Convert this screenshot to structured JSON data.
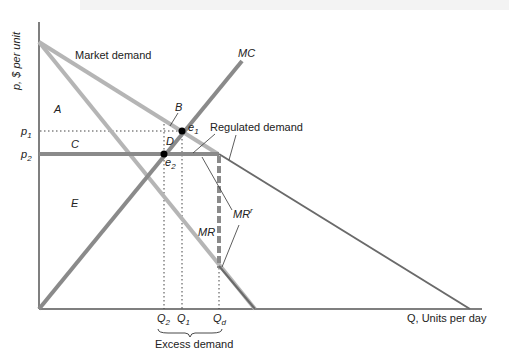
{
  "axes": {
    "y_label": "p, $ per unit",
    "x_label": "Q, Units per day",
    "y_ticks": [
      {
        "label": "p",
        "sub": "1"
      },
      {
        "label": "p",
        "sub": "2"
      }
    ],
    "x_ticks": [
      {
        "label": "Q",
        "sub": "2"
      },
      {
        "label": "Q",
        "sub": "1"
      },
      {
        "label": "Q",
        "sub": "d"
      }
    ]
  },
  "curves": {
    "market_demand": "Market demand",
    "mc": "MC",
    "mr": "MR",
    "mr_regulated": "MR",
    "mr_regulated_sup": "r",
    "regulated_demand": "Regulated demand"
  },
  "areas": {
    "a": "A",
    "b": "B",
    "c": "C",
    "d": "D",
    "e": "E"
  },
  "points": {
    "e1": {
      "label": "e",
      "sub": "1"
    },
    "e2": {
      "label": "e",
      "sub": "2"
    }
  },
  "annotations": {
    "excess_demand": "Excess demand"
  },
  "colors": {
    "demand": "#b5b5b5",
    "mr": "#b5b5b5",
    "mc": "#8a8a8a",
    "regulated": "#8a8a8a",
    "regulated_tail": "#6a6a6a",
    "axis": "#555555",
    "point": "#000000"
  }
}
